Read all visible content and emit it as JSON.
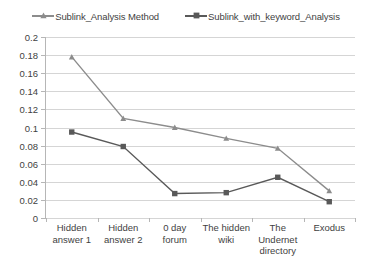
{
  "chart_data": {
    "type": "line",
    "title": "",
    "xlabel": "",
    "ylabel": "",
    "ylim": [
      0,
      0.2
    ],
    "ytick_step": 0.02,
    "yticks": [
      "0.2",
      "0.18",
      "0.16",
      "0.14",
      "0.12",
      "0.1",
      "0.08",
      "0.06",
      "0.04",
      "0.02",
      "0"
    ],
    "grid": true,
    "legend_position": "top-center",
    "categories": [
      "Hidden answer 1",
      "Hidden answer 2",
      "0 day forum",
      "The hidden wiki",
      "The Undernet directory",
      "Exodus"
    ],
    "series": [
      {
        "name": "Sublink_Analysis Method",
        "marker": "triangle",
        "color": "#8c8c8c",
        "values": [
          0.178,
          0.11,
          0.1,
          0.088,
          0.077,
          0.03
        ]
      },
      {
        "name": "Sublink_with_keyword_Analysis",
        "marker": "square",
        "color": "#595959",
        "values": [
          0.095,
          0.079,
          0.027,
          0.028,
          0.045,
          0.018
        ]
      }
    ]
  },
  "colors": {
    "gridline": "#d5d5d5",
    "axis": "#b6b6b6",
    "text": "#3f3f3f",
    "background": "#ffffff"
  }
}
